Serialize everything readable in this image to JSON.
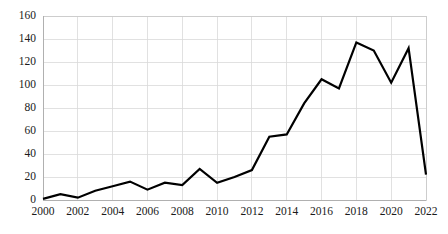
{
  "chart_data": {
    "type": "line",
    "title": "",
    "subtitle": "",
    "xlabel": "",
    "ylabel": "",
    "xlim": [
      2000,
      2022
    ],
    "ylim": [
      0,
      160
    ],
    "ytick_step": 20,
    "xtick_step": 2,
    "grid": true,
    "legend": false,
    "legend_position": "none",
    "line_color": "#000000",
    "gridline_color": "#d9d9d9",
    "background_color": "#ffffff",
    "x": [
      2000,
      2001,
      2002,
      2003,
      2004,
      2005,
      2006,
      2007,
      2008,
      2009,
      2010,
      2011,
      2012,
      2013,
      2014,
      2015,
      2016,
      2017,
      2018,
      2019,
      2020,
      2021,
      2022
    ],
    "values": [
      1,
      5,
      2,
      8,
      12,
      16,
      9,
      15,
      13,
      27,
      15,
      20,
      26,
      55,
      57,
      84,
      105,
      97,
      137,
      130,
      102,
      132,
      22
    ],
    "series": [
      {
        "name": "series-1",
        "values": [
          1,
          5,
          2,
          8,
          12,
          16,
          9,
          15,
          13,
          27,
          15,
          20,
          26,
          55,
          57,
          84,
          105,
          97,
          137,
          130,
          102,
          132,
          22
        ]
      }
    ],
    "ytick_labels": [
      "0",
      "20",
      "40",
      "60",
      "80",
      "100",
      "120",
      "140",
      "160"
    ],
    "ytick_values": [
      0,
      20,
      40,
      60,
      80,
      100,
      120,
      140,
      160
    ],
    "xtick_labels": [
      "2000",
      "2002",
      "2004",
      "2006",
      "2008",
      "2010",
      "2012",
      "2014",
      "2016",
      "2018",
      "2020",
      "2022"
    ],
    "xtick_values": [
      2000,
      2002,
      2004,
      2006,
      2008,
      2010,
      2012,
      2014,
      2016,
      2018,
      2020,
      2022
    ],
    "annotations": []
  }
}
